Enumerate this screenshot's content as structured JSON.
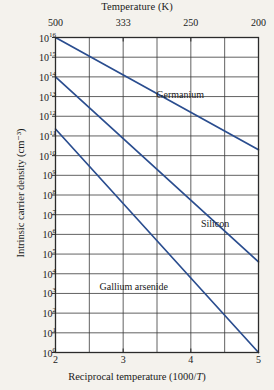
{
  "chart_data": {
    "type": "line",
    "title": "",
    "xlabel": "Reciprocal temperature (1000/T)",
    "ylabel": "Intrinsic carrier density (cm⁻³)",
    "top_axis_label": "Temperature (K)",
    "xlim": [
      2,
      5
    ],
    "ylim_exponent": [
      0,
      16
    ],
    "yscale": "log",
    "grid": true,
    "legend_position": "inline-annotations",
    "x_ticks": [
      {
        "value": 2,
        "label": "2"
      },
      {
        "value": 3,
        "label": "3"
      },
      {
        "value": 4,
        "label": "4"
      },
      {
        "value": 5,
        "label": "5"
      }
    ],
    "x_gridlines": [
      2,
      2.5,
      3,
      3.5,
      4,
      4.5,
      5
    ],
    "top_ticks": [
      {
        "value": 2,
        "label": "500"
      },
      {
        "value": 3,
        "label": "333"
      },
      {
        "value": 4,
        "label": "250"
      },
      {
        "value": 5,
        "label": "200"
      }
    ],
    "y_ticks": [
      {
        "exponent": 16,
        "label": "10",
        "sup": "16"
      },
      {
        "exponent": 15,
        "label": "10",
        "sup": "15"
      },
      {
        "exponent": 14,
        "label": "10",
        "sup": "14"
      },
      {
        "exponent": 13,
        "label": "10",
        "sup": "13"
      },
      {
        "exponent": 12,
        "label": "10",
        "sup": "12"
      },
      {
        "exponent": 11,
        "label": "10",
        "sup": "11"
      },
      {
        "exponent": 10,
        "label": "10",
        "sup": "10"
      },
      {
        "exponent": 9,
        "label": "10",
        "sup": "9"
      },
      {
        "exponent": 8,
        "label": "10",
        "sup": "8"
      },
      {
        "exponent": 7,
        "label": "10",
        "sup": "7"
      },
      {
        "exponent": 6,
        "label": "10",
        "sup": "6"
      },
      {
        "exponent": 5,
        "label": "10",
        "sup": "5"
      },
      {
        "exponent": 4,
        "label": "10",
        "sup": "4"
      },
      {
        "exponent": 3,
        "label": "10",
        "sup": "3"
      },
      {
        "exponent": 2,
        "label": "10",
        "sup": "2"
      },
      {
        "exponent": 1,
        "label": "10",
        "sup": "1"
      },
      {
        "exponent": 0,
        "label": "10",
        "sup": "0"
      }
    ],
    "y_gridline_exponents": [
      16,
      15,
      14,
      13,
      12,
      11,
      10,
      9,
      8,
      7,
      6,
      5,
      4,
      3,
      2,
      1,
      0
    ],
    "series": [
      {
        "name": "Germanium",
        "color": "#2a4d8f",
        "label_x": 3.49,
        "label_y_exponent": 13.1,
        "points": [
          {
            "x": 2,
            "y_exponent": 16.0
          },
          {
            "x": 5,
            "y_exponent": 10.3
          }
        ]
      },
      {
        "name": "Silicon",
        "color": "#2a4d8f",
        "label_x": 4.15,
        "label_y_exponent": 6.55,
        "points": [
          {
            "x": 2,
            "y_exponent": 14.0
          },
          {
            "x": 5,
            "y_exponent": 4.6
          }
        ]
      },
      {
        "name": "Gallium arsenide",
        "color": "#2a4d8f",
        "label_x": 2.65,
        "label_y_exponent": 3.35,
        "points": [
          {
            "x": 2,
            "y_exponent": 11.35
          },
          {
            "x": 5,
            "y_exponent": 0.0
          }
        ]
      }
    ],
    "colors": {
      "background": "#f4f2ed",
      "line": "#2a4d8f",
      "grid": "#3a3a3a",
      "frame": "#2b2b2b",
      "text": "#1a1a1a"
    }
  }
}
